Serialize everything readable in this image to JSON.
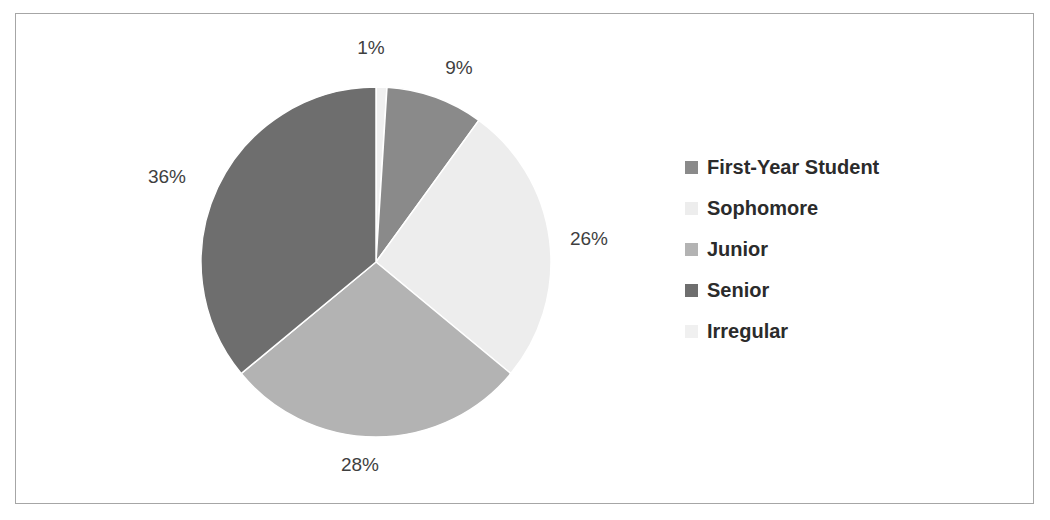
{
  "chart_data": {
    "type": "pie",
    "title": "",
    "subtitle": "",
    "categories": [
      "First-Year Student",
      "Sophomore",
      "Junior",
      "Senior",
      "Irregular"
    ],
    "values": [
      9,
      26,
      28,
      36,
      1
    ],
    "value_labels": [
      "9%",
      "26%",
      "28%",
      "36%",
      "1%"
    ],
    "unit": "%",
    "colors": [
      "#8a8a8a",
      "#ededed",
      "#b3b3b3",
      "#6e6e6e",
      "#f0f0f0"
    ],
    "legend_position": "right",
    "grid": false,
    "start_angle_deg": 0,
    "direction": "clockwise",
    "slice_order_from_top_clockwise": [
      "Irregular",
      "First-Year Student",
      "Sophomore",
      "Junior",
      "Senior"
    ],
    "slices": [
      {
        "label": "Irregular",
        "value": 1,
        "value_label": "1%",
        "color": "#f0f0f0",
        "start_deg": 0,
        "end_deg": 3.6,
        "label_x": 355,
        "label_y": 34,
        "label_anchor": "middle"
      },
      {
        "label": "First-Year Student",
        "value": 9,
        "value_label": "9%",
        "color": "#8a8a8a",
        "start_deg": 3.6,
        "end_deg": 36,
        "label_x": 443,
        "label_y": 54,
        "label_anchor": "middle"
      },
      {
        "label": "Sophomore",
        "value": 26,
        "value_label": "26%",
        "color": "#ededed",
        "start_deg": 36,
        "end_deg": 129.6,
        "label_x": 573,
        "label_y": 225,
        "label_anchor": "middle"
      },
      {
        "label": "Junior",
        "value": 28,
        "value_label": "28%",
        "color": "#b3b3b3",
        "start_deg": 129.6,
        "end_deg": 230.4,
        "label_x": 344,
        "label_y": 451,
        "label_anchor": "middle"
      },
      {
        "label": "Senior",
        "value": 36,
        "value_label": "36%",
        "color": "#6e6e6e",
        "start_deg": 230.4,
        "end_deg": 360,
        "label_x": 151,
        "label_y": 163,
        "label_anchor": "middle"
      }
    ],
    "geometry": {
      "cx": 360,
      "cy": 248,
      "r": 175
    }
  },
  "legend": {
    "items": [
      {
        "label": "First-Year Student",
        "color": "#8a8a8a"
      },
      {
        "label": "Sophomore",
        "color": "#ededed"
      },
      {
        "label": "Junior",
        "color": "#b3b3b3"
      },
      {
        "label": "Senior",
        "color": "#6e6e6e"
      },
      {
        "label": "Irregular",
        "color": "#f0f0f0"
      }
    ]
  },
  "frame": {
    "border_color": "#a6a6a6",
    "background": "#ffffff"
  }
}
